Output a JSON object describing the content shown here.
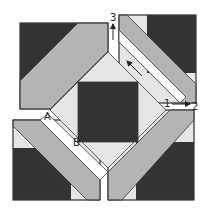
{
  "diagram": {
    "colors": {
      "dark": "#333333",
      "light": "#e6e6e6",
      "gray": "#b4b4b4",
      "background": "#ffffff",
      "outline": "#3a3a3a"
    },
    "labels": {
      "a": "A",
      "b": "B",
      "one": "1",
      "two": "2",
      "three": "3"
    },
    "annotations": [
      {
        "id": "arrow-1-to-2",
        "from": "1",
        "to": "2",
        "direction": "right"
      },
      {
        "id": "arrow-up-3",
        "to": "3",
        "direction": "up"
      },
      {
        "id": "arrow-diagonal",
        "direction": "up-left"
      }
    ],
    "components": [
      "top-left-corner-block",
      "top-right-corner-block",
      "bottom-left-corner-block",
      "bottom-right-corner-block",
      "center-diamond-block",
      "white-sashing-strips"
    ]
  }
}
